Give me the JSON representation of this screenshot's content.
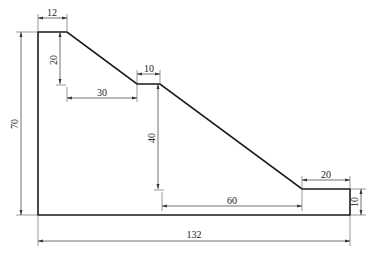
{
  "drawing": {
    "type": "dimensioned stepped-slope profile",
    "colors": {
      "outline": "#1a1a1a",
      "dimension": "#333333",
      "background": "#ffffff"
    },
    "dimensions": {
      "top_width": "12",
      "first_slope_drop": "20",
      "first_slope_run": "30",
      "middle_step_width": "10",
      "second_slope_drop": "40",
      "second_slope_run": "60",
      "bottom_step_width": "20",
      "bottom_step_height": "10",
      "total_height": "70",
      "total_width": "132"
    }
  }
}
